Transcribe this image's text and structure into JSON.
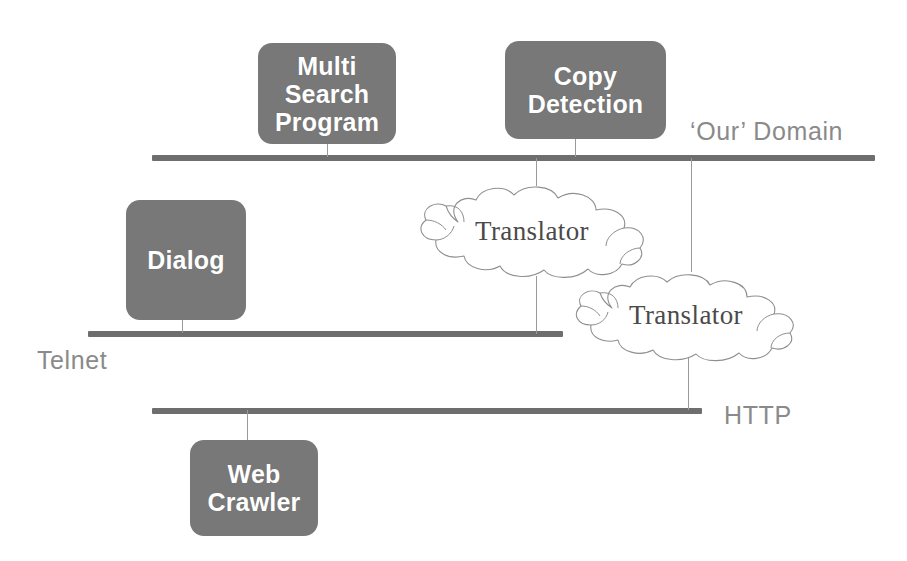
{
  "diagram": {
    "colors": {
      "box_fill": "#787878",
      "box_text": "#ffffff",
      "bus_bar": "#6e6e6e",
      "label_text": "#8a8a8a",
      "cloud_stroke": "#8f8f8f",
      "cloud_text": "#4a4a4a",
      "connector": "#9a9a9a",
      "background": "#ffffff"
    },
    "nodes": [
      {
        "id": "multi-search-program",
        "label": "Multi\nSearch\nProgram",
        "x": 258,
        "y": 43,
        "w": 138,
        "h": 101,
        "font_size": 25
      },
      {
        "id": "copy-detection",
        "label": "Copy\nDetection",
        "x": 505,
        "y": 41,
        "w": 161,
        "h": 98,
        "font_size": 25
      },
      {
        "id": "dialog",
        "label": "Dialog",
        "x": 126,
        "y": 200,
        "w": 120,
        "h": 120,
        "font_size": 25
      },
      {
        "id": "web-crawler",
        "label": "Web\nCrawler",
        "x": 190,
        "y": 440,
        "w": 128,
        "h": 96,
        "font_size": 25
      }
    ],
    "buses": [
      {
        "id": "our-domain",
        "label": "‘Our’ Domain",
        "x": 152,
        "y": 155,
        "w": 723,
        "label_x": 690,
        "label_y": 117
      },
      {
        "id": "telnet",
        "label": "Telnet",
        "x": 88,
        "y": 331,
        "w": 475,
        "label_x": 37,
        "label_y": 346
      },
      {
        "id": "http",
        "label": "HTTP",
        "x": 152,
        "y": 408,
        "w": 550,
        "label_x": 724,
        "label_y": 401
      }
    ],
    "clouds": [
      {
        "id": "translator-upper",
        "label": "Translator",
        "x": 406,
        "y": 182,
        "w": 252,
        "h": 100,
        "label_top": 34
      },
      {
        "id": "translator-lower",
        "label": "Translator",
        "x": 562,
        "y": 270,
        "w": 248,
        "h": 95,
        "label_top": 30
      }
    ],
    "connectors": [
      {
        "id": "msp-to-our-domain",
        "x": 327,
        "y": 144,
        "h": 13
      },
      {
        "id": "copy-detection-to-our-domain",
        "x": 575,
        "y": 139,
        "h": 18
      },
      {
        "id": "our-domain-to-translator-upper",
        "x": 536,
        "y": 158,
        "h": 28
      },
      {
        "id": "our-domain-to-translator-lower",
        "x": 691,
        "y": 158,
        "h": 114
      },
      {
        "id": "translator-upper-to-telnet",
        "x": 536,
        "y": 276,
        "h": 58
      },
      {
        "id": "translator-lower-to-http",
        "x": 688,
        "y": 356,
        "h": 54
      },
      {
        "id": "dialog-to-telnet",
        "x": 182,
        "y": 318,
        "h": 15
      },
      {
        "id": "http-to-web-crawler",
        "x": 247,
        "y": 410,
        "h": 32
      }
    ]
  }
}
